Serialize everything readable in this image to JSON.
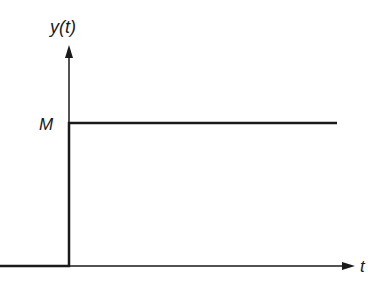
{
  "diagram": {
    "type": "step-function",
    "y_axis_label": "y(t)",
    "x_axis_label": "t",
    "level_label": "M",
    "colors": {
      "line": "#1a1a1a",
      "background": "#ffffff"
    }
  }
}
